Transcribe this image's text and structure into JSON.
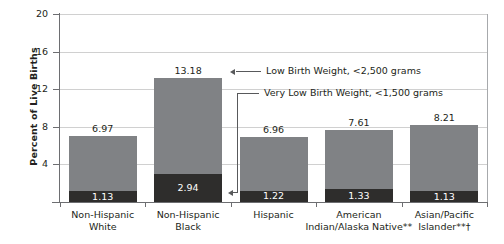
{
  "chart_data": {
    "type": "bar",
    "subtype": "stacked",
    "title": "",
    "xlabel": "",
    "ylabel": "Percent of Live Births",
    "ylim": [
      0,
      20
    ],
    "yticks": [
      20,
      16,
      12,
      8,
      4
    ],
    "grid": true,
    "legend_position": "annotation-callouts",
    "categories": [
      "Non-Hispanic White",
      "Non-Hispanic Black",
      "Hispanic",
      "American Indian/Alaska Native**",
      "Asian/Pacific Islander**†"
    ],
    "category_lines": [
      [
        "Non-Hispanic",
        "White"
      ],
      [
        "Non-Hispanic",
        "Black"
      ],
      [
        "Hispanic",
        ""
      ],
      [
        "American",
        "Indian/Alaska Native**"
      ],
      [
        "Asian/Pacific",
        "Islander**†"
      ]
    ],
    "series": [
      {
        "name": "Low Birth Weight, <2,500 grams",
        "color": "#808285",
        "values": [
          6.97,
          13.18,
          6.96,
          7.61,
          8.21
        ],
        "labels": [
          "6.97",
          "13.18",
          "6.96",
          "7.61",
          "8.21"
        ]
      },
      {
        "name": "Very Low Birth Weight, <1,500 grams",
        "color": "#2e2d2c",
        "values": [
          1.13,
          2.94,
          1.22,
          1.33,
          1.13
        ],
        "labels": [
          "1.13",
          "2.94",
          "1.22",
          "1.33",
          "1.13"
        ]
      }
    ],
    "annotations": [
      {
        "id": "low-birth-weight",
        "text": "Low Birth Weight, <2,500 grams",
        "points_to": "Non-Hispanic Black upper segment"
      },
      {
        "id": "very-low-birth-weight",
        "text": "Very Low Birth Weight, <1,500 grams",
        "points_to": "Hispanic lower segment"
      }
    ]
  },
  "colors": {
    "low_birth_weight": "#808285",
    "very_low_birth_weight": "#2e2d2c",
    "axis": "#6d6e71",
    "grid": "#d0d0d0",
    "text": "#231f20"
  }
}
